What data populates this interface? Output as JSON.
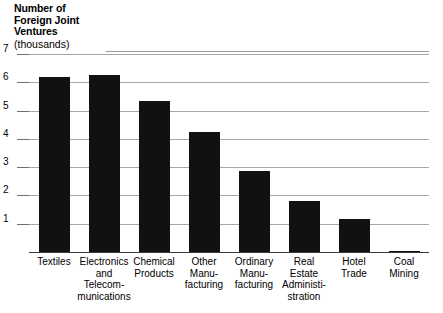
{
  "chart_data": {
    "type": "bar",
    "title": "Number of Foreign Joint Ventures",
    "title_lines": [
      "Number of",
      "Foreign Joint",
      "Ventures"
    ],
    "units": "(thousands)",
    "xlabel": "",
    "ylabel": "Number of Foreign Joint Ventures (thousands)",
    "ylim": [
      0,
      7
    ],
    "yticks": [
      1,
      2,
      3,
      4,
      5,
      6,
      7
    ],
    "ytick_labels": [
      "1",
      "2",
      "3",
      "4",
      "5",
      "6",
      "7"
    ],
    "grid": true,
    "legend": false,
    "bar_color": "#111111",
    "grid_color": "#a6a6a6",
    "categories": [
      "Textiles",
      "Electronics and Telecommunications",
      "Chemical Products",
      "Other Manufacturing",
      "Ordinary Manufacturing",
      "Real Estate Administration",
      "Hotel Trade",
      "Coal Mining"
    ],
    "category_label_lines": [
      [
        "Textiles"
      ],
      [
        "Electronics",
        "and",
        "Telecom-",
        "munications"
      ],
      [
        "Chemical",
        "Products"
      ],
      [
        "Other",
        "Manu-",
        "facturing"
      ],
      [
        "Ordinary",
        "Manu-",
        "facturing"
      ],
      [
        "Real",
        "Estate",
        "Administi-",
        "stration"
      ],
      [
        "Hotel",
        "Trade"
      ],
      [
        "Coal",
        "Mining"
      ]
    ],
    "values": [
      6.2,
      6.25,
      5.35,
      4.25,
      2.85,
      1.8,
      1.18,
      0.05
    ]
  }
}
